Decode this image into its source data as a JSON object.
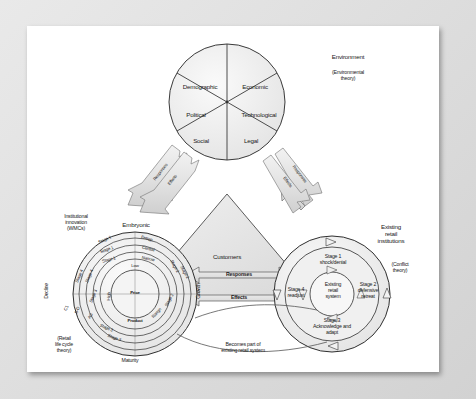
{
  "environment": {
    "heading": "Environment",
    "theory": "(Environmental\ntheory)",
    "segments": [
      {
        "label": "Demographic"
      },
      {
        "label": "Economic"
      },
      {
        "label": "Technological"
      },
      {
        "label": "Legal"
      },
      {
        "label": "Social"
      },
      {
        "label": "Political"
      }
    ]
  },
  "customers": {
    "label": "Customers"
  },
  "flows": {
    "left_diagonal": [
      "Responses",
      "Effects"
    ],
    "right_diagonal": [
      "Responses",
      "Effects"
    ],
    "horizontal": [
      "Responses",
      "Effects"
    ]
  },
  "innovation": {
    "heading": "Institutional\ninnovation\n(WMCs)",
    "theory": "(Retail\nlife cycle\ntheory)",
    "phase_top": "Embryonic",
    "phase_left": "Decline",
    "phase_right": "Growth",
    "phase_bottom": "Maturity",
    "center": "Price",
    "inner_ring": [
      "Low",
      "Range",
      "Product",
      "High"
    ],
    "ring2": [
      "Stage 1",
      "Stage 2",
      "Stage 3",
      "Stage 4"
    ],
    "ring3": [
      "Stage 1",
      "Stage 2",
      "Stage 3",
      "Stage 4"
    ],
    "ring4": [
      "Stage 1",
      "Stage 2",
      "Stage 3",
      "Stage 4"
    ],
    "attributes": [
      "Entrep.",
      "Central",
      "Narrow",
      "Low",
      "Range",
      "Product",
      "High",
      "C1",
      "S-D",
      "AG"
    ],
    "outer_labels": [
      "Stage 1",
      "Stage 1",
      "Stage 1",
      "Stage 2",
      "Stage 2",
      "Stage 3",
      "Stage 3",
      "Stage 4",
      "Stage 4"
    ]
  },
  "existing": {
    "heading": "Existing\nretail\ninstitutions",
    "theory": "(Conflict\ntheory)",
    "center": "Existing\nretail\nsystem",
    "stages": [
      {
        "label": "Stage 1\nshock/denial"
      },
      {
        "label": "Stage 2\ndefensive\nretreat"
      },
      {
        "label": "Stage 3\nAcknowledge and\nadapt"
      },
      {
        "label": "Stage 4\nreadjust"
      }
    ]
  },
  "becomes": "Becomes part of\nexisting retail system",
  "colors": {
    "fill_light": "#ededed",
    "fill_mid": "#e0e0e0",
    "stroke": "#3a3a3a",
    "text": "#1a1a1a",
    "page": "#ffffff"
  }
}
